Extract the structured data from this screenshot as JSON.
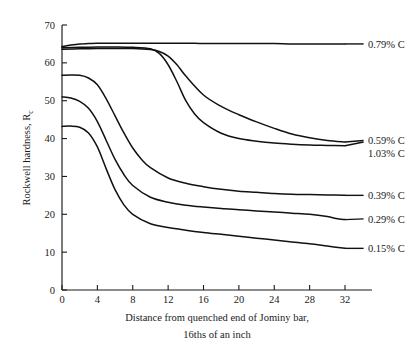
{
  "chart_data": {
    "type": "line",
    "title": "",
    "xlabel": "Distance from quenched end of Jominy bar,",
    "xlabel_line2": "16ths of an inch",
    "ylabel": "Rockwell hardness, R",
    "ylabel_subscript": "c",
    "xlim": [
      0,
      32
    ],
    "ylim": [
      0,
      70
    ],
    "xticks": [
      0,
      4,
      8,
      12,
      16,
      20,
      24,
      28,
      32
    ],
    "yticks": [
      0,
      10,
      20,
      30,
      40,
      50,
      60,
      70
    ],
    "xtick_labels": [
      "0",
      "4",
      "8",
      "12",
      "16",
      "20",
      "24",
      "28",
      "32"
    ],
    "ytick_labels": [
      "0",
      "10",
      "20",
      "30",
      "40",
      "50",
      "60",
      "70"
    ],
    "grid": false,
    "legend_position": "right-inline-labels",
    "line_color": "#111111",
    "series": [
      {
        "name": "0.79% C",
        "label": "0.79% C",
        "label_y": 64.8,
        "x": [
          0,
          1,
          2,
          3,
          4,
          6,
          8,
          10,
          12,
          14,
          16,
          18,
          20,
          22,
          24,
          26,
          28,
          30,
          32
        ],
        "values": [
          64.3,
          64.7,
          65.0,
          65.1,
          65.2,
          65.2,
          65.2,
          65.2,
          65.2,
          65.2,
          65.1,
          65.1,
          65.1,
          65.1,
          65.1,
          65.0,
          65.0,
          65.0,
          65.0
        ]
      },
      {
        "name": "0.59% C",
        "label": "0.59% C",
        "label_y": 39.5,
        "x": [
          0,
          2,
          4,
          6,
          8,
          10,
          11,
          12,
          13,
          14,
          16,
          18,
          20,
          22,
          24,
          26,
          28,
          30,
          32
        ],
        "values": [
          63.6,
          63.7,
          63.8,
          63.8,
          63.8,
          63.5,
          63.0,
          61.8,
          59.5,
          56.5,
          51.5,
          48.5,
          46.3,
          44.4,
          42.7,
          41.2,
          40.2,
          39.5,
          39.1
        ]
      },
      {
        "name": "1.03% C",
        "label": "1.03% C",
        "label_y": 36.2,
        "x": [
          0,
          2,
          4,
          6,
          8,
          10,
          11,
          12,
          13,
          14,
          15,
          16,
          18,
          20,
          22,
          24,
          26,
          28,
          30,
          32
        ],
        "values": [
          64.0,
          64.1,
          64.2,
          64.2,
          64.1,
          63.7,
          62.5,
          59.5,
          55.0,
          50.0,
          46.5,
          44.2,
          41.4,
          40.0,
          39.3,
          38.8,
          38.5,
          38.3,
          38.2,
          38.1
        ]
      },
      {
        "name": "0.39% C",
        "label": "0.39% C",
        "label_y": 25.0,
        "x": [
          0,
          1,
          2,
          3,
          4,
          5,
          6,
          7,
          8,
          9,
          10,
          12,
          14,
          16,
          18,
          20,
          22,
          24,
          26,
          28,
          30,
          32
        ],
        "values": [
          56.7,
          56.8,
          56.7,
          56.0,
          54.2,
          50.5,
          46.0,
          41.5,
          37.5,
          34.5,
          32.3,
          29.6,
          28.2,
          27.3,
          26.6,
          26.1,
          25.8,
          25.5,
          25.3,
          25.2,
          25.1,
          25.0
        ]
      },
      {
        "name": "0.29% C",
        "label": "0.29% C",
        "label_y": 18.8,
        "x": [
          0,
          1,
          2,
          3,
          4,
          5,
          6,
          7,
          8,
          10,
          12,
          14,
          16,
          18,
          20,
          22,
          24,
          26,
          28,
          30,
          31,
          32
        ],
        "values": [
          51.0,
          50.7,
          49.8,
          48.0,
          44.5,
          39.5,
          34.5,
          30.5,
          27.6,
          24.5,
          23.2,
          22.4,
          21.9,
          21.5,
          21.2,
          20.9,
          20.6,
          20.3,
          20.0,
          19.4,
          18.9,
          18.6
        ]
      },
      {
        "name": "0.15% C",
        "label": "0.15% C",
        "label_y": 11.0,
        "x": [
          0,
          1,
          2,
          3,
          4,
          5,
          6,
          7,
          8,
          10,
          12,
          14,
          16,
          18,
          20,
          22,
          24,
          26,
          28,
          30,
          32
        ],
        "values": [
          43.2,
          43.3,
          43.0,
          41.5,
          37.8,
          32.0,
          26.5,
          22.5,
          20.0,
          17.5,
          16.5,
          15.8,
          15.2,
          14.7,
          14.2,
          13.7,
          13.2,
          12.7,
          12.2,
          11.6,
          11.0
        ]
      }
    ],
    "label_leaders": [
      {
        "series": "0.79% C",
        "x1": 32.0,
        "y1": 65.0,
        "x2": 34.1,
        "y2": 65.0
      },
      {
        "series": "0.59% C",
        "x1": 32.0,
        "y1": 39.1,
        "x2": 34.1,
        "y2": 39.5
      },
      {
        "series": "1.03% C",
        "x1": 32.0,
        "y1": 38.1,
        "x2": 34.1,
        "y2": 39.1
      },
      {
        "series": "0.39% C",
        "x1": 32.0,
        "y1": 25.0,
        "x2": 34.1,
        "y2": 25.0
      },
      {
        "series": "0.29% C",
        "x1": 32.0,
        "y1": 18.6,
        "x2": 34.1,
        "y2": 18.8
      },
      {
        "series": "0.15% C",
        "x1": 32.0,
        "y1": 11.0,
        "x2": 34.1,
        "y2": 11.0
      }
    ]
  }
}
